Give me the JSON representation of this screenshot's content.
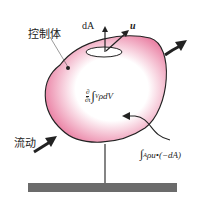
{
  "diagram": {
    "labels": {
      "control_volume": "控制体",
      "flow": "流动",
      "area_element": "dA",
      "velocity": "u",
      "time_derivative_term": "∂/∂t ∫V ρdV",
      "flux_term": "∫A ρu•(−dA)"
    },
    "time_derivative": {
      "numerator": "∂",
      "denominator": "∂t",
      "integral": "∫",
      "subscript": "V",
      "integrand": "ρdV"
    },
    "flux": {
      "integral": "∫",
      "subscript": "A",
      "integrand": "ρu•(−dA)"
    },
    "colors": {
      "fill_pink": "#e8739a",
      "outline": "#222222",
      "ground": "#6b6b6b"
    }
  }
}
